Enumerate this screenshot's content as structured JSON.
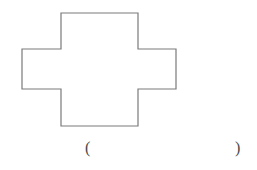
{
  "page": {
    "background_color": "#ffffff",
    "width": 257,
    "height": 170
  },
  "figure": {
    "name": "cross-shape-outline",
    "shape_type": "cross",
    "stroke_color": "#7a7a7a",
    "fill_color": "#ffffff",
    "stroke_width": 1.2,
    "points": "61,13 138,13 138,49 176,49 176,89 138,89 138,126 61,126 61,89 22,89 22,49 61,49",
    "bounds": {
      "left": 22,
      "top": 13,
      "right": 176,
      "bottom": 126,
      "width": 154,
      "height": 113
    },
    "arm_widths": {
      "vertical_bar_left": 61,
      "vertical_bar_right": 138,
      "horizontal_bar_top": 49,
      "horizontal_bar_bottom": 89
    }
  },
  "answer": {
    "paren_open": "(",
    "paren_close": ")",
    "blank_value": "",
    "blank_placeholder": ""
  }
}
